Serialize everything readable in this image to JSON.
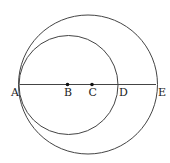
{
  "diagram": {
    "type": "geometry",
    "stroke_color": "#444444",
    "line": {
      "from": "A",
      "to": "E",
      "y": 84.5
    },
    "points": [
      {
        "label": "A",
        "x": 19.5,
        "y": 84.5,
        "dot": false,
        "label_x": 11,
        "label_y": 96
      },
      {
        "label": "B",
        "x": 67.5,
        "y": 84.5,
        "dot": true,
        "label_x": 64,
        "label_y": 96
      },
      {
        "label": "C",
        "x": 92,
        "y": 84.5,
        "dot": true,
        "label_x": 88.5,
        "label_y": 96
      },
      {
        "label": "D",
        "x": 117,
        "y": 84.5,
        "dot": false,
        "label_x": 119,
        "label_y": 96
      },
      {
        "label": "E",
        "x": 156,
        "y": 84.5,
        "dot": false,
        "label_x": 158,
        "label_y": 96
      }
    ],
    "circles": [
      {
        "name": "large-circle",
        "cx": 88,
        "cy": 84.5,
        "r": 69.5,
        "through": [
          "A",
          "E"
        ]
      },
      {
        "name": "small-circle",
        "cx": 68.5,
        "cy": 85,
        "r": 49.5,
        "through": [
          "A",
          "D"
        ]
      }
    ]
  }
}
